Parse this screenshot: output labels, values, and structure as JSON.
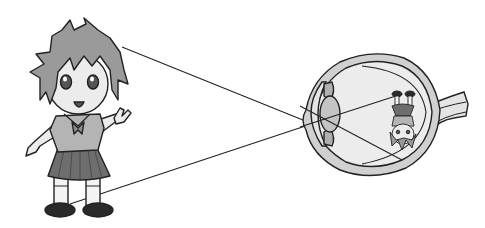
{
  "diagram": {
    "background": "#ffffff",
    "colors": {
      "outline": "#222222",
      "hair": "#9a9a9a",
      "skin": "#ececec",
      "shirt": "#b4b4b4",
      "skirt": "#6e6e6e",
      "shoes": "#2a2a2a",
      "eyeball_fill": "#e9e9e9",
      "lens": "#c4c4c4",
      "sclera_band": "#d0d0d0"
    },
    "elements": {
      "object": "Cartoon girl waving (peace sign)",
      "eye": "Cross-section of eyeball with lens, iris, retina and optic nerve",
      "rays": "Two straight lines from head and feet crossing at the lens",
      "image": "Small inverted copy of the girl on the retina"
    }
  }
}
